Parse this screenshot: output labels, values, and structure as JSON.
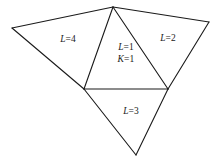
{
  "figure": {
    "type": "triangulated-mesh-diagram",
    "background_color": "#ffffff",
    "stroke_color": "#1a1a1a",
    "stroke_width": 1.1,
    "width": 219,
    "height": 164
  },
  "vertices": {
    "top_apex": {
      "name": "top-apex",
      "x": 113,
      "y": 7
    },
    "left_outer": {
      "name": "left-outer",
      "x": 12,
      "y": 28
    },
    "right_outer": {
      "name": "right-outer",
      "x": 209,
      "y": 22
    },
    "left_junction": {
      "name": "left-junction",
      "x": 84,
      "y": 89
    },
    "right_junction": {
      "name": "right-junction",
      "x": 168,
      "y": 89
    },
    "bottom_apex": {
      "name": "bottom-apex",
      "x": 136,
      "y": 155
    }
  },
  "faces": [
    {
      "id": "face-left",
      "points": "12,28 113,7 84,89",
      "label_lines": [
        "L=4"
      ],
      "label_vars": [
        "L"
      ],
      "label_x": 68,
      "label_y": 40
    },
    {
      "id": "face-right",
      "points": "113,7 209,22 168,89",
      "label_lines": [
        "L=2"
      ],
      "label_vars": [
        "L"
      ],
      "label_x": 168,
      "label_y": 39
    },
    {
      "id": "face-center",
      "points": "113,7 168,89 84,89",
      "label_lines": [
        "L=1",
        "K=1"
      ],
      "label_vars": [
        "L",
        "K"
      ],
      "label_x": 126,
      "label_y": 54
    },
    {
      "id": "face-bottom",
      "points": "84,89 168,89 136,155",
      "label_lines": [
        "L=3"
      ],
      "label_vars": [
        "L"
      ],
      "label_x": 131,
      "label_y": 112
    }
  ],
  "edges": [
    {
      "id": "edge-left-top",
      "x1": 12,
      "y1": 28,
      "x2": 113,
      "y2": 7
    },
    {
      "id": "edge-top-right",
      "x1": 113,
      "y1": 7,
      "x2": 209,
      "y2": 22
    },
    {
      "id": "edge-left-junction",
      "x1": 12,
      "y1": 28,
      "x2": 84,
      "y2": 89
    },
    {
      "id": "edge-right-junction",
      "x1": 209,
      "y1": 22,
      "x2": 168,
      "y2": 89
    },
    {
      "id": "edge-top-leftjunc",
      "x1": 113,
      "y1": 7,
      "x2": 84,
      "y2": 89
    },
    {
      "id": "edge-top-rightjunc",
      "x1": 113,
      "y1": 7,
      "x2": 168,
      "y2": 89
    },
    {
      "id": "edge-horizontal-base",
      "x1": 84,
      "y1": 89,
      "x2": 168,
      "y2": 89
    },
    {
      "id": "edge-leftjunc-bottom",
      "x1": 84,
      "y1": 89,
      "x2": 136,
      "y2": 155
    },
    {
      "id": "edge-rightjunc-bottom",
      "x1": 168,
      "y1": 89,
      "x2": 136,
      "y2": 155
    }
  ],
  "labels": {
    "face_left": {
      "full": "L=4",
      "variable": "L",
      "value": "4"
    },
    "face_right": {
      "full": "L=2",
      "variable": "L",
      "value": "2"
    },
    "face_center_line1": {
      "full": "L=1",
      "variable": "L",
      "value": "1"
    },
    "face_center_line2": {
      "full": "K=1",
      "variable": "K",
      "value": "1"
    },
    "face_bottom": {
      "full": "L=3",
      "variable": "L",
      "value": "3"
    }
  }
}
